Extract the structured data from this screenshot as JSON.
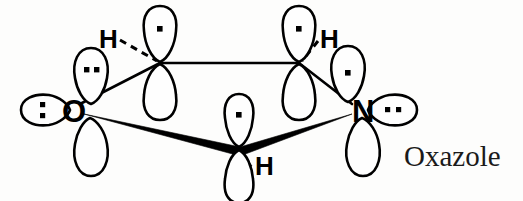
{
  "figure": {
    "compound_name": "Oxazole",
    "compound_name_position": {
      "x": 404,
      "y": 140
    },
    "background_color": "#fdfdfc",
    "stroke_color": "#000000",
    "width": 523,
    "height": 201
  },
  "atoms": [
    {
      "id": "oxygen",
      "symbol": "O",
      "label_x": 62,
      "label_y": 96,
      "ring_x": 74,
      "ring_y": 110
    },
    {
      "id": "nitrogen",
      "symbol": "N",
      "label_x": 352,
      "label_y": 96,
      "ring_x": 362,
      "ring_y": 110
    },
    {
      "id": "hydrogen-left",
      "symbol": "H",
      "label_x": 99,
      "label_y": 26
    },
    {
      "id": "hydrogen-right",
      "symbol": "H",
      "label_x": 320,
      "label_y": 26
    },
    {
      "id": "hydrogen-bottom",
      "symbol": "H",
      "label_x": 255,
      "label_y": 153
    }
  ],
  "orbitals": [
    {
      "id": "oxygen-lone-pair-up",
      "atom": "oxygen",
      "kind": "sp2-lobe",
      "direction": "up",
      "electron_count": 2,
      "dot_arrangement": "horizontal"
    },
    {
      "id": "oxygen-lone-pair-left",
      "atom": "oxygen",
      "kind": "sp2-lobe",
      "direction": "left",
      "electron_count": 2,
      "dot_arrangement": "vertical"
    },
    {
      "id": "oxygen-p-lobe-down",
      "atom": "oxygen",
      "kind": "p-lobe",
      "direction": "down",
      "electron_count": 0,
      "dot_arrangement": "none"
    },
    {
      "id": "nitrogen-p-lobe-up",
      "atom": "nitrogen",
      "kind": "p-lobe",
      "direction": "up",
      "electron_count": 1,
      "dot_arrangement": "single"
    },
    {
      "id": "nitrogen-lone-pair-right",
      "atom": "nitrogen",
      "kind": "sp2-lobe",
      "direction": "right",
      "electron_count": 2,
      "dot_arrangement": "horizontal"
    },
    {
      "id": "nitrogen-p-lobe-down",
      "atom": "nitrogen",
      "kind": "p-lobe",
      "direction": "down",
      "electron_count": 0,
      "dot_arrangement": "none"
    },
    {
      "id": "carbon-left-p-orbital",
      "atom": "carbon-top-left",
      "kind": "p-orbital",
      "direction": "vertical",
      "electron_count": 1,
      "dot_arrangement": "single"
    },
    {
      "id": "carbon-right-p-orbital",
      "atom": "carbon-top-right",
      "kind": "p-orbital",
      "direction": "vertical",
      "electron_count": 1,
      "dot_arrangement": "single"
    },
    {
      "id": "carbon-bottom-p-orbital",
      "atom": "carbon-bottom",
      "kind": "p-orbital",
      "direction": "vertical",
      "electron_count": 1,
      "dot_arrangement": "single"
    }
  ],
  "bonds": [
    {
      "id": "bond-c-c-top",
      "style": "plain",
      "from": "carbon-top-left",
      "to": "carbon-top-right"
    },
    {
      "id": "bond-o-c-left",
      "style": "plain",
      "from": "oxygen",
      "to": "carbon-top-left"
    },
    {
      "id": "bond-n-c-right",
      "style": "plain",
      "from": "nitrogen",
      "to": "carbon-top-right"
    },
    {
      "id": "bond-o-c-bottom",
      "style": "wedge",
      "from": "oxygen",
      "to": "carbon-bottom"
    },
    {
      "id": "bond-n-c-bottom",
      "style": "wedge",
      "from": "nitrogen",
      "to": "carbon-bottom"
    },
    {
      "id": "bond-c-h-left",
      "style": "dashed",
      "from": "carbon-top-left",
      "to": "hydrogen-left"
    },
    {
      "id": "bond-c-h-right",
      "style": "dashed",
      "from": "carbon-top-right",
      "to": "hydrogen-right"
    },
    {
      "id": "bond-c-h-bottom",
      "style": "wedge",
      "from": "carbon-bottom",
      "to": "hydrogen-bottom"
    }
  ]
}
